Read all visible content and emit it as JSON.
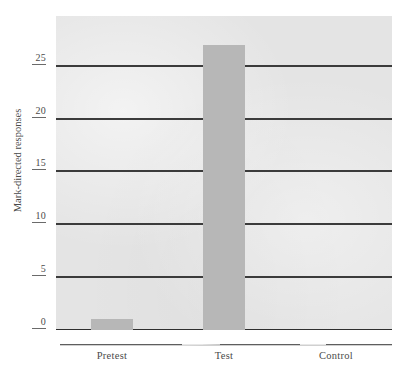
{
  "chart_data": {
    "type": "bar",
    "title": "",
    "subtitle": "",
    "xlabel": "",
    "ylabel": "Mark-directed responses",
    "categories": [
      "Pretest",
      "Test",
      "Control"
    ],
    "values": [
      1,
      27,
      0
    ],
    "series": [
      {
        "name": "Mark-directed responses",
        "values": [
          1,
          27,
          0
        ]
      }
    ],
    "ylim": [
      0,
      29.7
    ],
    "yticks": [
      0,
      5,
      10,
      15,
      20,
      25
    ],
    "ytick_labels": [
      "0",
      "5",
      "10",
      "15",
      "20",
      "25"
    ],
    "grid": true,
    "grid_axis": "y",
    "legend": false,
    "legend_position": "none",
    "annotations": [],
    "colors": {
      "bar": "#b7b7b7",
      "plot_background": "#e4e4e4",
      "figure_background": "#ffffff",
      "gridline": "#3b3b3b",
      "axis": "#5e5e5e",
      "text": "#4a4a4a"
    }
  },
  "axes": {
    "y": {
      "title": "Mark-directed responses",
      "ticks": [
        {
          "label": "25",
          "value": 25
        },
        {
          "label": "20",
          "value": 20
        },
        {
          "label": "15",
          "value": 15
        },
        {
          "label": "10",
          "value": 10
        },
        {
          "label": "5",
          "value": 5
        },
        {
          "label": "0",
          "value": 0
        }
      ]
    },
    "x": {
      "title": "",
      "ticks": [
        {
          "label": "Pretest"
        },
        {
          "label": "Test"
        },
        {
          "label": "Control"
        }
      ]
    }
  },
  "bars": [
    {
      "category": "Pretest",
      "value": 1
    },
    {
      "category": "Test",
      "value": 27
    },
    {
      "category": "Control",
      "value": 0
    }
  ]
}
